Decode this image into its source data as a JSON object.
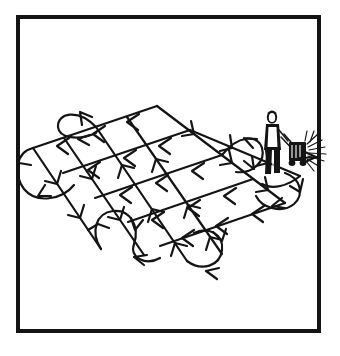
{
  "figure": {
    "title": "Lawn mowing crosshatch pattern",
    "style": "black ink line art on white, framed by a rectangular border",
    "border_color": "#141414",
    "line_color": "#141414",
    "background_color": "#ffffff"
  },
  "frame": {
    "name": "outer-border",
    "x": 16,
    "y": 15,
    "width": 305,
    "height": 318,
    "stroke_width": 4
  },
  "lawn": {
    "shape": "parallelogram-in-perspective",
    "corners": {
      "top": [
        157,
        106
      ],
      "left": [
        33,
        148
      ],
      "right": [
        285,
        173
      ],
      "bottom": [
        168,
        248
      ]
    }
  },
  "mower_operator": {
    "name": "person-pushing-mower",
    "position": [
      273,
      143
    ],
    "facing": "right",
    "parts": [
      "head",
      "torso",
      "arms",
      "legs",
      "handle",
      "mower-body",
      "grass-clippings-spray"
    ]
  },
  "grass_clippings": {
    "name": "grass-clipping-spray",
    "position": [
      306,
      152
    ],
    "ray_count": 9
  },
  "pass_directions": [
    {
      "name": "direction-a",
      "label": "first set of parallel passes",
      "count": 5,
      "bearing": "upper-left to lower-right",
      "turn_style": "u-turn-loop"
    },
    {
      "name": "direction-b",
      "label": "second set of parallel passes",
      "count": 5,
      "bearing": "lower-left to upper-right",
      "turn_style": "u-turn-loop"
    }
  ],
  "arrow_glyph": {
    "name": "chevron-barb",
    "style": "open V barb",
    "count_approx": 46
  },
  "loops": [
    {
      "name": "loop-top-left",
      "center": [
        79,
        117
      ]
    },
    {
      "name": "loop-left",
      "center": [
        32,
        160
      ]
    },
    {
      "name": "loop-bottom-left",
      "center": [
        123,
        240
      ]
    },
    {
      "name": "loop-bottom",
      "center": [
        200,
        253
      ]
    },
    {
      "name": "loop-right-upper",
      "center": [
        248,
        134
      ]
    },
    {
      "name": "loop-right-lower",
      "center": [
        288,
        192
      ]
    }
  ]
}
